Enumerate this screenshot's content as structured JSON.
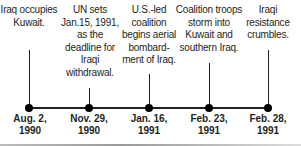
{
  "timeline": {
    "events": [
      {
        "description": "Iraq occupies Kuwait.",
        "date_line1": "Aug. 2,",
        "date_line2": "1990"
      },
      {
        "description": "UN sets Jan.15, 1991, as the deadline for Iraqi withdrawal.",
        "date_line1": "Nov. 29,",
        "date_line2": "1990"
      },
      {
        "description": "U.S.-led coalition begins aerial bombard- ment of Iraq.",
        "date_line1": "Jan. 16,",
        "date_line2": "1991"
      },
      {
        "description": "Coalition troops storm into Kuwait and southern Iraq.",
        "date_line1": "Feb. 23,",
        "date_line2": "1991"
      },
      {
        "description": "Iraqi resistance crumbles.",
        "date_line1": "Feb. 28,",
        "date_line2": "1991"
      }
    ]
  }
}
